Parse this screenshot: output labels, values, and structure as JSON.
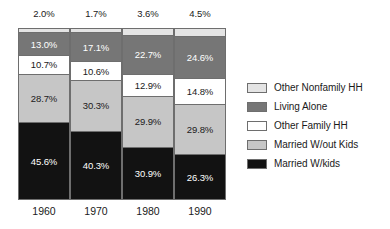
{
  "chart_data": {
    "type": "bar",
    "subtype": "stacked-100-percent",
    "title": "",
    "subtitle": "",
    "xlabel": "",
    "ylabel": "",
    "ylim": [
      0,
      100
    ],
    "grid": false,
    "legend_position": "right",
    "categories": [
      "1960",
      "1970",
      "1980",
      "1990"
    ],
    "series": [
      {
        "name": "Married W/kids",
        "values": [
          45.6,
          40.3,
          30.9,
          26.3
        ],
        "color": "#121212"
      },
      {
        "name": "Married W/out Kids",
        "values": [
          28.7,
          30.3,
          29.9,
          29.8
        ],
        "color": "#c6c6c6"
      },
      {
        "name": "Other Family HH",
        "values": [
          10.7,
          10.6,
          12.9,
          14.8
        ],
        "color": "#ffffff"
      },
      {
        "name": "Living Alone",
        "values": [
          13.0,
          17.1,
          22.7,
          24.6
        ],
        "color": "#767676"
      },
      {
        "name": "Other Nonfamily HH",
        "values": [
          2.0,
          1.7,
          3.6,
          4.5
        ],
        "color": "#e4e4e4"
      }
    ]
  },
  "bars": [
    {
      "year": "1960",
      "top_label": "2.0%",
      "segments": [
        {
          "key": "nonfamily",
          "label": "2.0%",
          "value": 2.0,
          "show_label": false
        },
        {
          "key": "living",
          "label": "13.0%",
          "value": 13.0,
          "show_label": true
        },
        {
          "key": "otherfam",
          "label": "10.7%",
          "value": 10.7,
          "show_label": true
        },
        {
          "key": "marwo",
          "label": "28.7%",
          "value": 28.7,
          "show_label": true
        },
        {
          "key": "marw",
          "label": "45.6%",
          "value": 45.6,
          "show_label": true
        }
      ]
    },
    {
      "year": "1970",
      "top_label": "1.7%",
      "segments": [
        {
          "key": "nonfamily",
          "label": "1.7%",
          "value": 1.7,
          "show_label": false
        },
        {
          "key": "living",
          "label": "17.1%",
          "value": 17.1,
          "show_label": true
        },
        {
          "key": "otherfam",
          "label": "10.6%",
          "value": 10.6,
          "show_label": true
        },
        {
          "key": "marwo",
          "label": "30.3%",
          "value": 30.3,
          "show_label": true
        },
        {
          "key": "marw",
          "label": "40.3%",
          "value": 40.3,
          "show_label": true
        }
      ]
    },
    {
      "year": "1980",
      "top_label": "3.6%",
      "segments": [
        {
          "key": "nonfamily",
          "label": "3.6%",
          "value": 3.6,
          "show_label": false
        },
        {
          "key": "living",
          "label": "22.7%",
          "value": 22.7,
          "show_label": true
        },
        {
          "key": "otherfam",
          "label": "12.9%",
          "value": 12.9,
          "show_label": true
        },
        {
          "key": "marwo",
          "label": "29.9%",
          "value": 29.9,
          "show_label": true
        },
        {
          "key": "marw",
          "label": "30.9%",
          "value": 30.9,
          "show_label": true
        }
      ]
    },
    {
      "year": "1990",
      "top_label": "4.5%",
      "segments": [
        {
          "key": "nonfamily",
          "label": "4.5%",
          "value": 4.5,
          "show_label": false
        },
        {
          "key": "living",
          "label": "24.6%",
          "value": 24.6,
          "show_label": true
        },
        {
          "key": "otherfam",
          "label": "14.8%",
          "value": 14.8,
          "show_label": true
        },
        {
          "key": "marwo",
          "label": "29.8%",
          "value": 29.8,
          "show_label": true
        },
        {
          "key": "marw",
          "label": "26.3%",
          "value": 26.3,
          "show_label": true
        }
      ]
    }
  ],
  "legend": {
    "items": [
      {
        "key": "nonfamily",
        "label": "Other Nonfamily HH"
      },
      {
        "key": "living",
        "label": "Living Alone"
      },
      {
        "key": "otherfam",
        "label": "Other Family HH"
      },
      {
        "key": "marwo",
        "label": "Married W/out Kids"
      },
      {
        "key": "marw",
        "label": "Married W/kids"
      }
    ]
  },
  "colors": {
    "other_nonfamily_hh": "#e4e4e4",
    "living_alone": "#767676",
    "other_family_hh": "#ffffff",
    "married_without_kids": "#c6c6c6",
    "married_with_kids": "#121212",
    "outline": "#6e6e6e",
    "background": "#ffffff",
    "text": "#1a1a1a"
  }
}
